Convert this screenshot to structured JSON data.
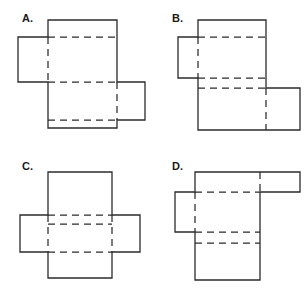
{
  "figure": {
    "background_color": "#ffffff",
    "line_color": "#2b2b2b",
    "label_color": "#1a1a1a",
    "width": 308,
    "height": 295
  },
  "panels": [
    {
      "id": "A",
      "label": "A.",
      "label_x": 22,
      "label_y": 22,
      "description": "Vertical strip with a left side flap high and a right side flap low",
      "outline": "M 48 20 L 117 20 L 117 82 L 145 82 L 145 120 L 117 120 L 117 128 L 48 128 L 48 82 L 18 82 L 18 37 L 48 37 Z",
      "folds": [
        "M 48 37 L 117 37",
        "M 48 82 L 117 82",
        "M 48 120 L 117 120",
        "M 48 37 L 48 82",
        "M 117 82 L 117 120"
      ]
    },
    {
      "id": "B",
      "label": "B.",
      "label_x": 172,
      "label_y": 22,
      "description": "Vertical strip with a left side flap high and a larger right side flap at the bottom",
      "outline": "M 198 20 L 266 20 L 266 88 L 300 88 L 300 130 L 266 130 L 266 130 L 198 130 L 198 78 L 178 78 L 178 37 L 198 37 Z",
      "folds": [
        "M 198 37 L 266 37",
        "M 198 78 L 266 78",
        "M 198 88 L 266 88",
        "M 198 37 L 198 78",
        "M 266 88 L 266 130"
      ]
    },
    {
      "id": "C",
      "label": "C.",
      "label_x": 22,
      "label_y": 170,
      "description": "Symmetric cross-like net with flaps on both left and right sides at mid height",
      "outline": "M 48 172 L 112 172 L 112 215 L 140 215 L 140 252 L 112 252 L 112 278 L 48 278 L 48 252 L 20 252 L 20 215 L 48 215 Z",
      "folds": [
        "M 48 215 L 112 215",
        "M 48 224 L 112 224",
        "M 48 252 L 112 252",
        "M 48 215 L 48 252",
        "M 112 215 L 112 252"
      ]
    },
    {
      "id": "D",
      "label": "D.",
      "label_x": 172,
      "label_y": 170,
      "description": "Vertical strip with a left side flap and a wide horizontal tab at the top right",
      "outline": "M 195 172 L 300 172 L 300 192 L 260 192 L 260 280 L 195 280 L 195 232 L 175 232 L 175 192 L 195 192 Z",
      "folds": [
        "M 195 192 L 260 192",
        "M 195 232 L 260 232",
        "M 195 243 L 260 243",
        "M 195 192 L 195 232",
        "M 260 172 L 260 192"
      ]
    }
  ]
}
